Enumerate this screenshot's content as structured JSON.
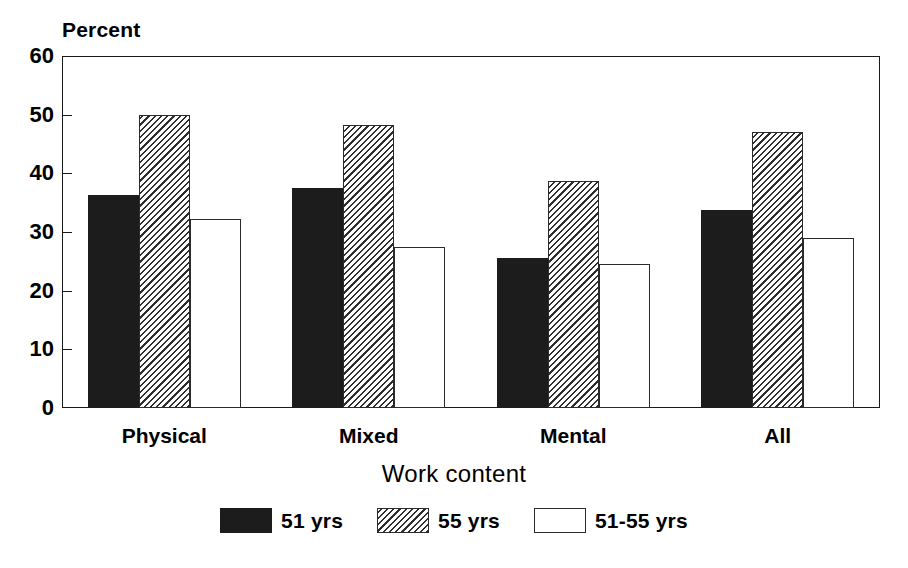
{
  "chart_data": {
    "type": "bar",
    "title": "",
    "subtitle": "",
    "categories": [
      "Physical",
      "Mixed",
      "Mental",
      "All"
    ],
    "series": [
      {
        "name": "51 yrs",
        "style": "solid",
        "values": [
          36.3,
          37.5,
          25.6,
          33.8
        ]
      },
      {
        "name": "55 yrs",
        "style": "hatch",
        "values": [
          50.0,
          48.3,
          38.7,
          47.0
        ]
      },
      {
        "name": "51-55 yrs",
        "style": "open",
        "values": [
          32.2,
          27.4,
          24.6,
          29.0
        ]
      }
    ],
    "xlabel": "Work content",
    "ylabel": "Percent",
    "ylim": [
      0,
      60
    ],
    "yticks": [
      0,
      10,
      20,
      30,
      40,
      50,
      60
    ],
    "ytick_labels": [
      "0",
      "10",
      "20",
      "30",
      "40",
      "50",
      "60"
    ],
    "grid": false,
    "legend_position": "bottom-center",
    "frame": "box",
    "colors": {
      "series_51": "#1c1c1c",
      "series_55": "#2e2e2e",
      "series_51_55": "#ffffff",
      "axis": "#1a1a1a",
      "background": "#ffffff"
    }
  },
  "axes": {
    "y_title": "Percent",
    "x_title": "Work content"
  },
  "legend": {
    "items": [
      {
        "label": "51 yrs",
        "style": "solid"
      },
      {
        "label": "55 yrs",
        "style": "hatch"
      },
      {
        "label": "51-55 yrs",
        "style": "open"
      }
    ]
  }
}
